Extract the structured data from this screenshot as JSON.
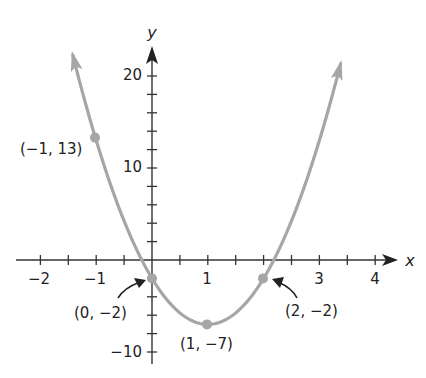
{
  "chart_data": {
    "type": "line",
    "title": "",
    "equation_implied": "y = 5x^2 - 10x - 2",
    "xlabel": "x",
    "ylabel": "y",
    "xlim": [
      -2,
      4
    ],
    "ylim": [
      -10,
      20
    ],
    "x_ticks": [
      -2,
      -1,
      1,
      3,
      4
    ],
    "x_minor_step": 0.5,
    "y_ticks": [
      -10,
      10,
      20
    ],
    "y_minor_step": 2,
    "grid": false,
    "legend": null,
    "curve_color": "#a6a6a6",
    "axis_color": "#333333",
    "curve_x_range": [
      -1.42,
      3.38
    ],
    "points": [
      {
        "x": -1,
        "y": 13,
        "label": "(−1, 13)"
      },
      {
        "x": 0,
        "y": -2,
        "label": "(0, −2)"
      },
      {
        "x": 1,
        "y": -7,
        "label": "(1, −7)"
      },
      {
        "x": 2,
        "y": -2,
        "label": "(2, −2)"
      }
    ]
  },
  "labels": {
    "x_axis": "x",
    "y_axis": "y",
    "tick_x_m2": "−2",
    "tick_x_m1": "−1",
    "tick_x_1": "1",
    "tick_x_3": "3",
    "tick_x_4": "4",
    "tick_y_20": "20",
    "tick_y_10": "10",
    "tick_y_m10": "−10",
    "pt_m1_13": "(−1, 13)",
    "pt_0_m2": "(0, −2)",
    "pt_1_m7": "(1, −7)",
    "pt_2_m2": "(2, −2)"
  }
}
